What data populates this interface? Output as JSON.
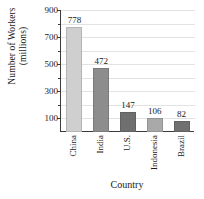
{
  "chart_data": {
    "type": "bar",
    "title": "",
    "subtitle": "",
    "xlabel": "Country",
    "ylabel": "Number of Workers (millions)",
    "ylabel_lines": [
      "Number of Workers",
      "(millions)"
    ],
    "categories": [
      "China",
      "India",
      "U.S.",
      "Indonesia",
      "Brazil"
    ],
    "values": [
      778,
      472,
      147,
      106,
      82
    ],
    "value_labels": [
      "778",
      "472",
      "147",
      "106",
      "82"
    ],
    "bar_colors": [
      "#cfcfcf",
      "#8d8d8d",
      "#6f6f6f",
      "#a9a9a9",
      "#707070"
    ],
    "ylim": [
      0,
      900
    ],
    "y_major_ticks": [
      900,
      700,
      500,
      300,
      100
    ],
    "y_major_tick_labels": [
      "900",
      "700",
      "500",
      "300",
      "100"
    ],
    "y_minor_ticks": [
      800,
      600,
      400,
      200
    ],
    "grid": true,
    "grid_axis": "y",
    "gridline_color": "#e2e2e2",
    "legend": "none",
    "axis_color": "#3a3a3a",
    "background": "#ffffff"
  }
}
